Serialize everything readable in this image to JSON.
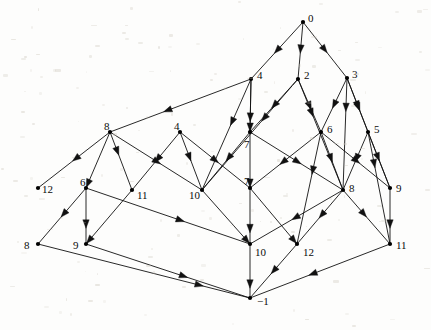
{
  "figure": {
    "kind": "directed-lattice-diagram",
    "background_color": "#fdfdfc",
    "edge_color": "#111111",
    "node_color": "#000000",
    "label_color": "#0b0b0b",
    "width": 431,
    "height": 330
  },
  "nodes": [
    {
      "id": "n0",
      "label": "0",
      "x": 303,
      "y": 22,
      "lx": 308,
      "ly": 13,
      "dot": true
    },
    {
      "id": "n1",
      "label": "4",
      "x": 251,
      "y": 79,
      "lx": 257,
      "ly": 70,
      "dot": true
    },
    {
      "id": "n2",
      "label": "2",
      "x": 298,
      "y": 79,
      "lx": 304,
      "ly": 70,
      "dot": true
    },
    {
      "id": "n3",
      "label": "3",
      "x": 347,
      "y": 78,
      "lx": 352,
      "ly": 69,
      "dot": true
    },
    {
      "id": "n4",
      "label": "8",
      "x": 110,
      "y": 132,
      "lx": 104,
      "ly": 121,
      "dot": true
    },
    {
      "id": "n5",
      "label": "4",
      "x": 180,
      "y": 132,
      "lx": 174,
      "ly": 121,
      "dot": true
    },
    {
      "id": "n6",
      "label": "7",
      "x": 250,
      "y": 132,
      "lx": 244,
      "ly": 139,
      "dot": true
    },
    {
      "id": "n7",
      "label": "6",
      "x": 321,
      "y": 132,
      "lx": 327,
      "ly": 124,
      "dot": true
    },
    {
      "id": "n8",
      "label": "5",
      "x": 368,
      "y": 132,
      "lx": 374,
      "ly": 124,
      "dot": true
    },
    {
      "id": "n9",
      "label": "12",
      "x": 38,
      "y": 188,
      "lx": 42,
      "ly": 184,
      "dot": true
    },
    {
      "id": "n10",
      "label": "6",
      "x": 86,
      "y": 188,
      "lx": 80,
      "ly": 177,
      "dot": true
    },
    {
      "id": "n11",
      "label": "11",
      "x": 132,
      "y": 190,
      "lx": 137,
      "ly": 190,
      "dot": true
    },
    {
      "id": "n12",
      "label": "10",
      "x": 202,
      "y": 190,
      "lx": 189,
      "ly": 190,
      "dot": true
    },
    {
      "id": "n13",
      "label": "7",
      "x": 250,
      "y": 188,
      "lx": 244,
      "ly": 176,
      "dot": true
    },
    {
      "id": "n14",
      "label": "8",
      "x": 343,
      "y": 190,
      "lx": 349,
      "ly": 183,
      "dot": true
    },
    {
      "id": "n15",
      "label": "9",
      "x": 390,
      "y": 188,
      "lx": 396,
      "ly": 183,
      "dot": true
    },
    {
      "id": "n16",
      "label": "8",
      "x": 38,
      "y": 244,
      "lx": 24,
      "ly": 240,
      "dot": true
    },
    {
      "id": "n17",
      "label": "9",
      "x": 86,
      "y": 244,
      "lx": 73,
      "ly": 240,
      "dot": true
    },
    {
      "id": "n18",
      "label": "10",
      "x": 250,
      "y": 244,
      "lx": 255,
      "ly": 247,
      "dot": true
    },
    {
      "id": "n19",
      "label": "12",
      "x": 297,
      "y": 244,
      "lx": 303,
      "ly": 247,
      "dot": true
    },
    {
      "id": "n20",
      "label": "11",
      "x": 390,
      "y": 244,
      "lx": 396,
      "ly": 240,
      "dot": true
    },
    {
      "id": "n21",
      "label": "−1",
      "x": 250,
      "y": 298,
      "lx": 257,
      "ly": 296,
      "dot": true
    }
  ],
  "edges": [
    {
      "from": "n0",
      "to": "n1",
      "arrow": "mid"
    },
    {
      "from": "n0",
      "to": "n2",
      "arrow": "mid"
    },
    {
      "from": "n0",
      "to": "n3",
      "arrow": "mid"
    },
    {
      "from": "n1",
      "to": "n4",
      "arrow": "mid"
    },
    {
      "from": "n1",
      "to": "n6",
      "arrow": "mid"
    },
    {
      "from": "n1",
      "to": "n12",
      "arrow": "mid"
    },
    {
      "from": "n2",
      "to": "n6",
      "arrow": "mid"
    },
    {
      "from": "n2",
      "to": "n7",
      "arrow": "mid"
    },
    {
      "from": "n2",
      "to": "n12",
      "arrow": "mid"
    },
    {
      "from": "n2",
      "to": "n14",
      "arrow": "mid"
    },
    {
      "from": "n3",
      "to": "n7",
      "arrow": "mid"
    },
    {
      "from": "n3",
      "to": "n8",
      "arrow": "mid"
    },
    {
      "from": "n3",
      "to": "n14",
      "arrow": "mid"
    },
    {
      "from": "n3",
      "to": "n15",
      "arrow": "mid"
    },
    {
      "from": "n4",
      "to": "n9",
      "arrow": "mid"
    },
    {
      "from": "n4",
      "to": "n10",
      "arrow": "none"
    },
    {
      "from": "n4",
      "to": "n11",
      "arrow": "mid"
    },
    {
      "from": "n4",
      "to": "n12",
      "arrow": "mid"
    },
    {
      "from": "n5",
      "to": "n11",
      "arrow": "mid"
    },
    {
      "from": "n5",
      "to": "n12",
      "arrow": "mid"
    },
    {
      "from": "n5",
      "to": "n13",
      "arrow": "mid"
    },
    {
      "from": "n6",
      "to": "n13",
      "arrow": "mid"
    },
    {
      "from": "n6",
      "to": "n12",
      "arrow": "mid"
    },
    {
      "from": "n6",
      "to": "n14",
      "arrow": "mid"
    },
    {
      "from": "n7",
      "to": "n13",
      "arrow": "mid"
    },
    {
      "from": "n7",
      "to": "n14",
      "arrow": "mid"
    },
    {
      "from": "n7",
      "to": "n15",
      "arrow": "mid"
    },
    {
      "from": "n7",
      "to": "n19",
      "arrow": "mid"
    },
    {
      "from": "n8",
      "to": "n14",
      "arrow": "mid"
    },
    {
      "from": "n8",
      "to": "n15",
      "arrow": "mid"
    },
    {
      "from": "n8",
      "to": "n20",
      "arrow": "mid"
    },
    {
      "from": "n10",
      "to": "n16",
      "arrow": "mid"
    },
    {
      "from": "n10",
      "to": "n17",
      "arrow": "mid"
    },
    {
      "from": "n10",
      "to": "n18",
      "arrow": "none"
    },
    {
      "from": "n11",
      "to": "n17",
      "arrow": "none"
    },
    {
      "from": "n12",
      "to": "n18",
      "arrow": "none"
    },
    {
      "from": "n13",
      "to": "n18",
      "arrow": "mid"
    },
    {
      "from": "n13",
      "to": "n19",
      "arrow": "none"
    },
    {
      "from": "n14",
      "to": "n18",
      "arrow": "mid"
    },
    {
      "from": "n14",
      "to": "n19",
      "arrow": "mid"
    },
    {
      "from": "n14",
      "to": "n20",
      "arrow": "mid"
    },
    {
      "from": "n15",
      "to": "n20",
      "arrow": "mid"
    },
    {
      "from": "n16",
      "to": "n21",
      "arrow": "none"
    },
    {
      "from": "n17",
      "to": "n21",
      "arrow": "mid"
    },
    {
      "from": "n18",
      "to": "n21",
      "arrow": "mid"
    },
    {
      "from": "n19",
      "to": "n21",
      "arrow": "mid"
    },
    {
      "from": "n20",
      "to": "n21",
      "arrow": "mid"
    },
    {
      "from": "n5",
      "to": "n6",
      "arrow": "none"
    },
    {
      "from": "n6",
      "to": "n7",
      "arrow": "none"
    },
    {
      "from": "n7",
      "to": "n8",
      "arrow": "none"
    },
    {
      "from": "n4",
      "to": "n5",
      "arrow": "none"
    },
    {
      "from": "n10",
      "to": "n11",
      "arrow": "none"
    },
    {
      "from": "n11",
      "to": "n12",
      "arrow": "none"
    },
    {
      "from": "n12",
      "to": "n13",
      "arrow": "none"
    },
    {
      "from": "n13",
      "to": "n14",
      "arrow": "none"
    },
    {
      "from": "n14",
      "to": "n15",
      "arrow": "none"
    }
  ],
  "edge_paths": [
    {
      "name": "0-4",
      "pts": "303,22 251,79",
      "arrow_at": 0.55
    },
    {
      "name": "0-2",
      "pts": "303,22 298,79",
      "arrow_at": 0.55
    },
    {
      "name": "0-3",
      "pts": "303,22 347,78",
      "arrow_at": 0.55
    },
    {
      "name": "4-8",
      "pts": "251,79 110,132",
      "arrow_at": 0.62
    },
    {
      "name": "4-7",
      "pts": "251,79 250,132",
      "arrow_at": 0.8
    },
    {
      "name": "4-10",
      "pts": "251,79 202,190",
      "arrow_at": 0.42
    },
    {
      "name": "4b-7b",
      "pts": "251,79 250,132",
      "arrow_at": 0.99
    },
    {
      "name": "2-7",
      "pts": "298,79 250,132",
      "arrow_at": 0.55
    },
    {
      "name": "2-6",
      "pts": "298,79 321,132",
      "arrow_at": 0.58
    },
    {
      "name": "2-10",
      "pts": "298,79 202,190",
      "arrow_at": 0.38
    },
    {
      "name": "2-8d",
      "pts": "298,79 343,190",
      "arrow_at": 0.34
    },
    {
      "name": "3-6",
      "pts": "347,78 321,132",
      "arrow_at": 0.56
    },
    {
      "name": "3-5",
      "pts": "347,78 368,132",
      "arrow_at": 0.58
    },
    {
      "name": "3-8d",
      "pts": "347,78 343,190",
      "arrow_at": 0.3
    },
    {
      "name": "3-9d",
      "pts": "347,78 390,188",
      "arrow_at": 0.3
    },
    {
      "name": "8-12",
      "pts": "110,132 38,188",
      "arrow_at": 0.52
    },
    {
      "name": "8-6l",
      "pts": "110,132 86,188",
      "arrow_at": 0.99
    },
    {
      "name": "8-11",
      "pts": "110,132 132,190",
      "arrow_at": 0.4
    },
    {
      "name": "8-10",
      "pts": "110,132 202,190",
      "arrow_at": 0.55
    },
    {
      "name": "4m-11",
      "pts": "180,132 132,190",
      "arrow_at": 0.52
    },
    {
      "name": "4m-10",
      "pts": "180,132 202,190",
      "arrow_at": 0.5
    },
    {
      "name": "4m-7l",
      "pts": "180,132 250,188",
      "arrow_at": 0.55
    },
    {
      "name": "7-7l",
      "pts": "250,132 250,188",
      "arrow_at": 0.99
    },
    {
      "name": "7-10l",
      "pts": "250,132 202,190",
      "arrow_at": 0.5
    },
    {
      "name": "7-8l",
      "pts": "250,132 343,190",
      "arrow_at": 0.55
    },
    {
      "name": "6-7l",
      "pts": "321,132 250,188",
      "arrow_at": 0.58
    },
    {
      "name": "6-8l",
      "pts": "321,132 343,190",
      "arrow_at": 0.52
    },
    {
      "name": "6-9l",
      "pts": "321,132 390,188",
      "arrow_at": 0.56
    },
    {
      "name": "6-12b",
      "pts": "321,132 297,244",
      "arrow_at": 0.38
    },
    {
      "name": "5-8l",
      "pts": "368,132 343,190",
      "arrow_at": 0.52
    },
    {
      "name": "5-9l",
      "pts": "368,132 390,188",
      "arrow_at": 0.52
    },
    {
      "name": "5-11b",
      "pts": "368,132 390,244",
      "arrow_at": 0.32
    },
    {
      "name": "6l-8b",
      "pts": "86,188 38,244",
      "arrow_at": 0.52
    },
    {
      "name": "6l-9b",
      "pts": "86,188 86,244",
      "arrow_at": 0.72
    },
    {
      "name": "6l-10b",
      "pts": "86,188 250,244",
      "arrow_at": 0.6
    },
    {
      "name": "11-9b",
      "pts": "132,190 86,244",
      "arrow_at": 0.99
    },
    {
      "name": "10-10b",
      "pts": "202,190 250,244",
      "arrow_at": 0.99
    },
    {
      "name": "7l-10b",
      "pts": "250,188 250,244",
      "arrow_at": 0.8
    },
    {
      "name": "7l-12b",
      "pts": "250,188 297,244",
      "arrow_at": 0.99
    },
    {
      "name": "8l-10b",
      "pts": "343,190 250,244",
      "arrow_at": 0.55
    },
    {
      "name": "8l-12b",
      "pts": "343,190 297,244",
      "arrow_at": 0.52
    },
    {
      "name": "8l-11b",
      "pts": "343,190 390,244",
      "arrow_at": 0.5
    },
    {
      "name": "9l-11b",
      "pts": "390,188 390,244",
      "arrow_at": 0.72
    },
    {
      "name": "8b-m1",
      "pts": "38,244 250,298",
      "arrow_at": 0.78
    },
    {
      "name": "9b-m1",
      "pts": "86,244 250,298",
      "arrow_at": 0.62
    },
    {
      "name": "10b-m1",
      "pts": "250,244 250,298",
      "arrow_at": 0.82
    },
    {
      "name": "12b-m1",
      "pts": "297,244 250,298",
      "arrow_at": 0.55
    },
    {
      "name": "11b-m1",
      "pts": "390,244 250,298",
      "arrow_at": 0.58
    }
  ]
}
